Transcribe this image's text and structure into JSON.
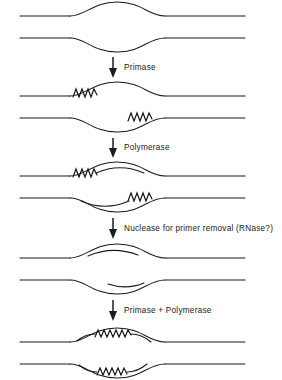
{
  "figure": {
    "background_color": "#ffffff",
    "line_color": "#1b1b1b",
    "text_color": "#1a1a1a"
  },
  "steps": [
    {
      "id": "step-1",
      "name": "replication-bubble-open",
      "caption": "",
      "description": "Parental duplex DNA with an open replication bubble; no primers yet",
      "strands": {
        "top_parental": true,
        "bottom_parental": true,
        "bubble_top_arc": true,
        "bubble_bottom_arc": true
      },
      "primers": [],
      "new_dna": []
    },
    {
      "id": "step-2",
      "name": "primers-laid-down",
      "caption": "",
      "description": "RNA primers synthesised on each template strand inside the bubble",
      "primers": [
        {
          "strand": "top",
          "position": "left"
        },
        {
          "strand": "bottom",
          "position": "right"
        }
      ],
      "new_dna": []
    },
    {
      "id": "step-3",
      "name": "primers-extended",
      "caption": "",
      "description": "Polymerase extends DNA from each RNA primer",
      "primers": [
        {
          "strand": "top",
          "position": "left"
        },
        {
          "strand": "bottom",
          "position": "right"
        }
      ],
      "new_dna": [
        {
          "strand": "top",
          "from": "left-primer",
          "direction": "rightward"
        },
        {
          "strand": "bottom",
          "from": "right-primer",
          "direction": "leftward"
        }
      ]
    },
    {
      "id": "step-4",
      "name": "primers-removed",
      "caption": "",
      "description": "Nuclease removes the RNA primers leaving only the new DNA segments",
      "primers": [],
      "new_dna": [
        {
          "strand": "top",
          "from": "left-gap",
          "direction": "rightward"
        },
        {
          "strand": "bottom",
          "from": "right-gap",
          "direction": "leftward"
        }
      ]
    },
    {
      "id": "step-5",
      "name": "reprimed-and-extended",
      "caption": "",
      "description": "New primers are laid down in the gaps and extended by polymerase",
      "primers": [
        {
          "strand": "top",
          "position": "middle"
        },
        {
          "strand": "bottom",
          "position": "middle"
        }
      ],
      "new_dna": [
        {
          "strand": "top",
          "from": "middle-primer",
          "direction": "both"
        },
        {
          "strand": "bottom",
          "from": "middle-primer",
          "direction": "both"
        }
      ]
    }
  ],
  "transitions": [
    {
      "id": "transition-1",
      "name": "primase",
      "label": "Primase",
      "arrow": "down-arrow"
    },
    {
      "id": "transition-2",
      "name": "polymerase",
      "label": "Polymerase",
      "arrow": "down-arrow"
    },
    {
      "id": "transition-3",
      "name": "nuclease",
      "label": "Nuclease for primer removal (RNase?)",
      "arrow": "down-arrow"
    },
    {
      "id": "transition-4",
      "name": "primase-plus-polymerase",
      "label": "Primase + Polymerase",
      "arrow": "down-arrow"
    }
  ]
}
